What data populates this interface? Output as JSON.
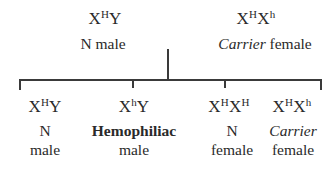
{
  "parents": [
    {
      "genotype": {
        "x1": "X",
        "s1": "H",
        "x2": "Y",
        "s2": ""
      },
      "label": {
        "emph": "",
        "rest": "N male"
      }
    },
    {
      "genotype": {
        "x1": "X",
        "s1": "H",
        "x2": "X",
        "s2": "h"
      },
      "label": {
        "emph": "Carrier",
        "rest": " female"
      }
    }
  ],
  "offspring": [
    {
      "genotype": {
        "x1": "X",
        "s1": "H",
        "x2": "Y",
        "s2": ""
      },
      "line1": "N",
      "line2": "male"
    },
    {
      "genotype": {
        "x1": "X",
        "s1": "h",
        "x2": "Y",
        "s2": ""
      },
      "line1": "Hemophiliac",
      "line2": "male"
    },
    {
      "genotype": {
        "x1": "X",
        "s1": "H",
        "x2": "X",
        "s2": "H"
      },
      "line1": "N",
      "line2": "female"
    },
    {
      "genotype": {
        "x1": "X",
        "s1": "H",
        "x2": "X",
        "s2": "h"
      },
      "line1": "Carrier",
      "line2": "female"
    }
  ],
  "colors": {
    "ink": "#2a2a2a",
    "line": "#3a3a3a",
    "background": "#ffffff"
  }
}
